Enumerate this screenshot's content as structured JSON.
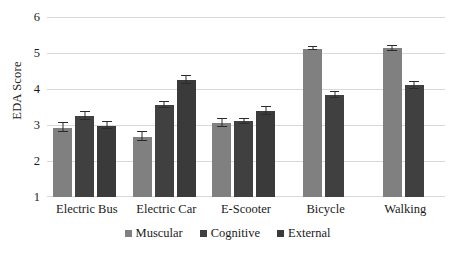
{
  "chart_data": {
    "type": "bar",
    "title": "",
    "xlabel": "",
    "ylabel": "EDA Score",
    "ylim": [
      1,
      6
    ],
    "yticks": [
      1,
      2,
      3,
      4,
      5,
      6
    ],
    "ytick_labels": [
      "1",
      "2",
      "3",
      "4",
      "5",
      "6"
    ],
    "grid": true,
    "legend_position": "bottom",
    "categories": [
      "Electric Bus",
      "Electric Car",
      "E-Scooter",
      "Bicycle",
      "Walking"
    ],
    "series": [
      {
        "name": "Muscular",
        "color": "#808080",
        "values": [
          2.93,
          2.68,
          3.05,
          5.12,
          5.13
        ],
        "errors": [
          0.13,
          0.12,
          0.11,
          0.05,
          0.07
        ]
      },
      {
        "name": "Cognitive",
        "color": "#404040",
        "values": [
          3.26,
          3.56,
          3.11,
          3.84,
          4.1
        ],
        "errors": [
          0.11,
          0.09,
          0.07,
          0.08,
          0.1
        ]
      },
      {
        "name": "External",
        "color": "#3a3a3a",
        "values": [
          2.98,
          4.25,
          3.39,
          null,
          null
        ],
        "errors": [
          0.1,
          0.1,
          0.1,
          null,
          null
        ]
      }
    ]
  },
  "legend": {
    "items": [
      {
        "label": "Muscular",
        "color": "#808080"
      },
      {
        "label": "Cognitive",
        "color": "#404040"
      },
      {
        "label": "External",
        "color": "#3a3a3a"
      }
    ]
  },
  "axes": {
    "y_title": "EDA Score"
  }
}
